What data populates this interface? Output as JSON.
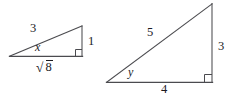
{
  "figure": {
    "kind": "geometry-diagram",
    "background_color": "#ffffff",
    "stroke_color": "#4b4b4f",
    "text_color": "#1b1b1f",
    "width": 230,
    "height": 96
  },
  "triangles": [
    {
      "id": "left-triangle",
      "name": "small-right-triangle",
      "right_angle_position": "bottom-right",
      "angle_label": "x",
      "angle_label_style": "italic",
      "sides": {
        "hypotenuse_label": "3",
        "base_label": "√8",
        "base_label_plain": "sqrt(8)",
        "vertical_label": "1"
      },
      "radical": {
        "sign": "√",
        "radicand": "8"
      },
      "vertices": {
        "left": [
          10,
          56
        ],
        "apex": [
          82,
          26
        ],
        "corner": [
          82,
          56
        ]
      }
    },
    {
      "id": "right-triangle",
      "name": "large-right-triangle",
      "right_angle_position": "bottom-right",
      "angle_label": "y",
      "angle_label_style": "italic",
      "sides": {
        "hypotenuse_label": "5",
        "base_label": "4",
        "vertical_label": "3"
      },
      "vertices": {
        "left": [
          107,
          82
        ],
        "apex": [
          212,
          4
        ],
        "corner": [
          212,
          82
        ]
      }
    }
  ],
  "labels": {
    "left_hypotenuse": "3",
    "left_vertical": "1",
    "left_angle": "x",
    "left_base_radical_sign": "√",
    "left_base_radicand": "8",
    "right_hypotenuse": "5",
    "right_vertical": "3",
    "right_angle": "y",
    "right_base": "4"
  }
}
